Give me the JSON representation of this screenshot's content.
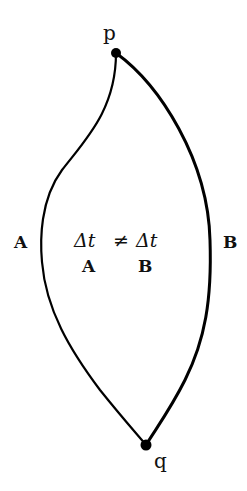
{
  "diagram": {
    "points": {
      "p": {
        "label": "p"
      },
      "q": {
        "label": "q"
      }
    },
    "paths": {
      "A": {
        "label": "A"
      },
      "B": {
        "label": "B"
      }
    },
    "equation": {
      "lhs": "Δt",
      "relation": "≠",
      "rhs": "Δt",
      "lhs_subscript": "A",
      "rhs_subscript": "B"
    },
    "colors": {
      "stroke": "#000000",
      "text": "#111111",
      "background": "#ffffff"
    }
  }
}
